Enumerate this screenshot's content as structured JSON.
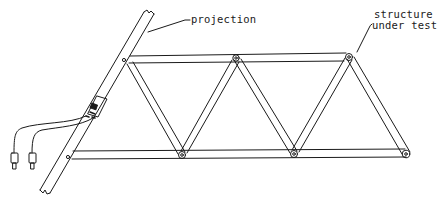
{
  "diagram": {
    "type": "truss test setup line drawing",
    "labels": {
      "projection": "projection",
      "structure_line1": "structure",
      "structure_line2": "under test"
    },
    "colors": {
      "line": "#1a1a1a",
      "background": "#ffffff"
    },
    "components": [
      "projection-bar",
      "truss-structure",
      "sensor-gauge",
      "cable-connectors"
    ]
  }
}
